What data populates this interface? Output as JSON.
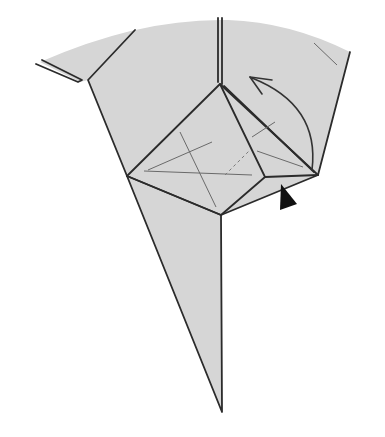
{
  "diagram": {
    "type": "origami-fold-step",
    "colors": {
      "paper": "#d6d6d6",
      "edge": "#2b2b2b",
      "crease": "#6a6a6a",
      "push_arrow": "#111111",
      "background": "#ffffff"
    },
    "symbols": [
      {
        "name": "fold-arrow",
        "description": "curved arrow indicating flap folded up-left"
      },
      {
        "name": "push-arrow",
        "description": "solid black triangle indicating push/sink"
      }
    ]
  }
}
